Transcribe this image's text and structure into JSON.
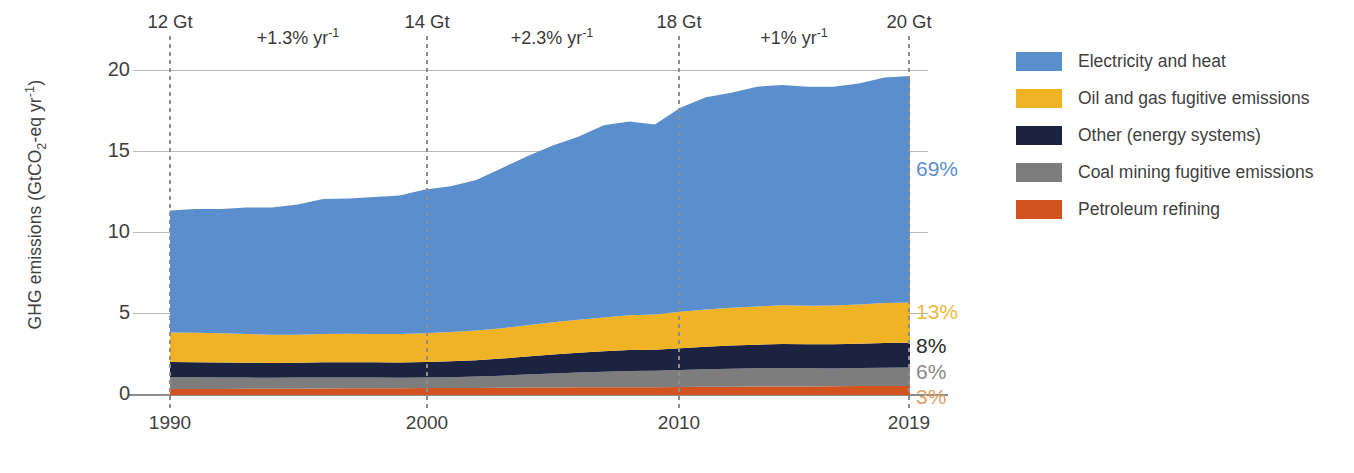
{
  "axes": {
    "ylabel": "GHG emissions (GtCO2-eq yr-1)",
    "ylabel_head": "GHG emissions (GtCO",
    "ylabel_sub": "2",
    "ylabel_mid": "-eq yr",
    "ylabel_sup": "-1",
    "ylabel_tail": ")",
    "yticks": [
      "0",
      "5",
      "10",
      "15",
      "20"
    ],
    "xticks": [
      "1990",
      "2000",
      "2010",
      "2019"
    ]
  },
  "annotations": {
    "gt_labels": [
      {
        "text": "12 Gt",
        "year": 1990
      },
      {
        "text": "14 Gt",
        "year": 2000
      },
      {
        "text": "18 Gt",
        "year": 2010
      },
      {
        "text": "20 Gt",
        "year": 2019
      }
    ],
    "rate_labels": [
      {
        "prefix": "+1.3% yr",
        "sup": "-1"
      },
      {
        "prefix": "+2.3% yr",
        "sup": "-1"
      },
      {
        "prefix": "+1% yr",
        "sup": "-1"
      }
    ],
    "share_labels": [
      {
        "text": "69%",
        "color": "#5B8ECC"
      },
      {
        "text": "13%",
        "color": "#F0B83C"
      },
      {
        "text": "8%",
        "color": "#2B2B2B"
      },
      {
        "text": "6%",
        "color": "#8A8A8A"
      },
      {
        "text": "3%",
        "color": "#E0A264"
      }
    ]
  },
  "legend": {
    "items": [
      {
        "label": "Electricity and heat",
        "color": "#5B8ECC"
      },
      {
        "label": "Oil and gas fugitive emissions",
        "color": "#F0B325"
      },
      {
        "label": "Other (energy systems)",
        "color": "#1B2341"
      },
      {
        "label": "Coal mining fugitive emissions",
        "color": "#7D7D7D"
      },
      {
        "label": "Petroleum refining",
        "color": "#D2531E"
      }
    ]
  },
  "chart_data": {
    "type": "area",
    "title": "",
    "subtitle": "",
    "xlabel": "",
    "ylabel": "GHG emissions (GtCO2-eq yr-1)",
    "xlim": [
      1990,
      2019
    ],
    "ylim": [
      0,
      21.5
    ],
    "grid": true,
    "legend_position": "right",
    "stacked": true,
    "stack_order_bottom_to_top": [
      "Petroleum refining",
      "Coal mining fugitive emissions",
      "Other (energy systems)",
      "Oil and gas fugitive emissions",
      "Electricity and heat"
    ],
    "x": [
      1990,
      1991,
      1992,
      1993,
      1994,
      1995,
      1996,
      1997,
      1998,
      1999,
      2000,
      2001,
      2002,
      2003,
      2004,
      2005,
      2006,
      2007,
      2008,
      2009,
      2010,
      2011,
      2012,
      2013,
      2014,
      2015,
      2016,
      2017,
      2018,
      2019
    ],
    "series": [
      {
        "name": "Petroleum refining",
        "color": "#D2531E",
        "share_2019": "3%",
        "values": [
          0.4,
          0.4,
          0.4,
          0.41,
          0.41,
          0.42,
          0.43,
          0.44,
          0.44,
          0.45,
          0.46,
          0.46,
          0.47,
          0.48,
          0.49,
          0.5,
          0.51,
          0.52,
          0.52,
          0.52,
          0.53,
          0.54,
          0.55,
          0.56,
          0.57,
          0.57,
          0.58,
          0.59,
          0.6,
          0.6
        ]
      },
      {
        "name": "Coal mining fugitive emissions",
        "color": "#7D7D7D",
        "share_2019": "6%",
        "values": [
          0.78,
          0.77,
          0.76,
          0.74,
          0.73,
          0.73,
          0.73,
          0.72,
          0.71,
          0.69,
          0.7,
          0.72,
          0.75,
          0.8,
          0.87,
          0.93,
          0.98,
          1.02,
          1.06,
          1.08,
          1.12,
          1.16,
          1.19,
          1.21,
          1.22,
          1.2,
          1.18,
          1.19,
          1.21,
          1.22
        ]
      },
      {
        "name": "Other (energy systems)",
        "color": "#1B2341",
        "share_2019": "8%",
        "values": [
          1.0,
          1.0,
          0.99,
          0.98,
          0.98,
          0.99,
          1.0,
          1.01,
          1.01,
          1.01,
          1.03,
          1.05,
          1.08,
          1.13,
          1.19,
          1.25,
          1.3,
          1.35,
          1.39,
          1.4,
          1.45,
          1.5,
          1.53,
          1.56,
          1.58,
          1.58,
          1.59,
          1.61,
          1.63,
          1.64
        ]
      },
      {
        "name": "Oil and gas fugitive emissions",
        "color": "#F0B325",
        "share_2019": "13%",
        "values": [
          1.95,
          1.95,
          1.93,
          1.9,
          1.86,
          1.85,
          1.87,
          1.88,
          1.88,
          1.88,
          1.9,
          1.93,
          1.96,
          2.01,
          2.07,
          2.13,
          2.18,
          2.24,
          2.3,
          2.32,
          2.4,
          2.46,
          2.5,
          2.53,
          2.56,
          2.56,
          2.57,
          2.6,
          2.64,
          2.66
        ]
      },
      {
        "name": "Electricity and heat",
        "color": "#5B8ECC",
        "share_2019": "69%",
        "values": [
          8.07,
          8.18,
          8.22,
          8.37,
          8.42,
          8.61,
          8.93,
          8.95,
          9.06,
          9.17,
          9.51,
          9.65,
          9.97,
          10.58,
          11.18,
          11.69,
          12.12,
          12.72,
          12.83,
          12.58,
          13.5,
          14.04,
          14.23,
          14.54,
          14.57,
          14.49,
          14.48,
          14.61,
          14.92,
          14.98
        ]
      }
    ],
    "totals": [
      12.2,
      12.3,
      12.3,
      12.4,
      12.4,
      12.6,
      12.96,
      13.0,
      13.1,
      13.2,
      13.6,
      13.81,
      14.23,
      15.0,
      15.8,
      16.5,
      17.09,
      17.85,
      18.1,
      17.9,
      19.0,
      19.7,
      20.0,
      20.4,
      20.5,
      20.4,
      20.4,
      20.6,
      21.0,
      21.1
    ],
    "total_annotations": {
      "1990": "12 Gt",
      "2000": "14 Gt",
      "2010": "18 Gt",
      "2019": "20 Gt"
    },
    "growth_annotations": [
      {
        "period": "1990-2000",
        "text": "+1.3% yr-1"
      },
      {
        "period": "2000-2010",
        "text": "+2.3% yr-1"
      },
      {
        "period": "2010-2019",
        "text": "+1% yr-1"
      }
    ]
  }
}
